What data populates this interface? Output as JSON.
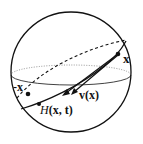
{
  "diagram": {
    "title": "",
    "colors": {
      "stroke": "#111111",
      "dotted": "#555555",
      "background": "#ffffff"
    },
    "labels": {
      "x": "x",
      "neg_x": "-x",
      "v": "v(x)",
      "H_italic": "H",
      "H_args": "(x, t)"
    },
    "points": [
      {
        "name": "x",
        "cx": 118,
        "cy": 54
      },
      {
        "name": "-x",
        "cx": 28,
        "cy": 94
      },
      {
        "name": "H(x,t)",
        "cx": 39,
        "cy": 104
      }
    ]
  }
}
